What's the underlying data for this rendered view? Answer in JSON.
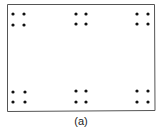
{
  "figure": {
    "caption": "(a)",
    "border_color": "#555555",
    "dot_color": "#111111",
    "rect": {
      "x": 7.5,
      "y": 4.5,
      "w": 147,
      "h": 106.5
    },
    "dot_radius": 1.6,
    "groups": [
      {
        "name": "top-left",
        "cols": [
          13,
          24
        ],
        "rows": [
          14,
          25
        ]
      },
      {
        "name": "top-center",
        "cols": [
          76,
          86
        ],
        "rows": [
          14,
          24
        ]
      },
      {
        "name": "top-right",
        "cols": [
          137,
          148
        ],
        "rows": [
          14,
          24
        ]
      },
      {
        "name": "bottom-left",
        "cols": [
          13,
          25
        ],
        "rows": [
          92,
          102
        ]
      },
      {
        "name": "bottom-center",
        "cols": [
          76,
          86
        ],
        "rows": [
          91,
          102
        ]
      },
      {
        "name": "bottom-right",
        "cols": [
          137,
          148
        ],
        "rows": [
          91,
          102
        ]
      }
    ]
  }
}
